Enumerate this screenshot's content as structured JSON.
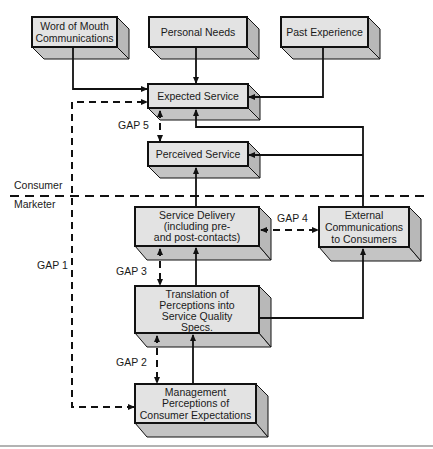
{
  "diagram": {
    "boxes": {
      "word_of_mouth": {
        "lines": [
          "Word of Mouth",
          "Communications"
        ]
      },
      "personal_needs": {
        "lines": [
          "Personal Needs"
        ]
      },
      "past_experience": {
        "lines": [
          "Past Experience"
        ]
      },
      "expected_service": {
        "lines": [
          "Expected Service"
        ]
      },
      "perceived_service": {
        "lines": [
          "Perceived Service"
        ]
      },
      "service_delivery": {
        "lines": [
          "Service Delivery",
          "(including pre-",
          "and post-contacts)"
        ]
      },
      "external_communications": {
        "lines": [
          "External",
          "Communications",
          "to Consumers"
        ]
      },
      "translation": {
        "lines": [
          "Translation of",
          "Perceptions into",
          "Service Quality",
          "Specs."
        ]
      },
      "management_perceptions": {
        "lines": [
          "Management",
          "Perceptions of",
          "Consumer Expectations"
        ]
      }
    },
    "zones": {
      "consumer": "Consumer",
      "marketer": "Marketer"
    },
    "gaps": {
      "gap1": "GAP 1",
      "gap2": "GAP 2",
      "gap3": "GAP 3",
      "gap4": "GAP 4",
      "gap5": "GAP 5"
    },
    "colors": {
      "box_front": "#e3e3e3",
      "box_side": "#b8b8b8",
      "box_bottom": "#c4c4c4",
      "stroke": "#111111",
      "rule": "#9a9a9a"
    }
  }
}
